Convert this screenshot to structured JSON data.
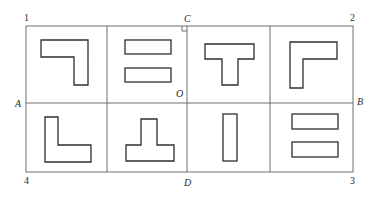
{
  "figure": {
    "background": "#ffffff",
    "line_color": "#6e6e6e",
    "shape_color": "#2f2f2f",
    "outer_frame": {
      "x": 26,
      "y": 26,
      "w": 327,
      "h": 146
    },
    "axes": {
      "vertical_CD_x": 187,
      "horizontal_AB_y": 103,
      "divider_left_x": 107,
      "divider_right_x": 270
    },
    "labels": {
      "corner_1": "1",
      "corner_2": "2",
      "corner_3": "3",
      "corner_4": "4",
      "point_A": "A",
      "point_B": "B",
      "point_C": "C",
      "point_D": "D",
      "point_O": "O"
    },
    "cells": [
      {
        "id": 1,
        "shape": "L-shape (corner top-right)",
        "points": "41,40 88,40 88,85 74,85 74,57 41,57"
      },
      {
        "id": 2,
        "shape": "two horizontal bars",
        "rects": [
          [
            125,
            40,
            46,
            14
          ],
          [
            125,
            68,
            46,
            14
          ]
        ]
      },
      {
        "id": 3,
        "shape": "T-shape",
        "points": "205,44 254,44 254,59 238,59 238,85 222,85 222,59 205,59"
      },
      {
        "id": 4,
        "shape": "L-shape (corner top-left)",
        "points": "290,42 337,42 337,59 303,59 303,88 290,88"
      },
      {
        "id": 5,
        "shape": "L-shape (corner bottom-left)",
        "points": "45,117 58,117 58,145 91,145 91,162 45,162"
      },
      {
        "id": 6,
        "shape": "inverted T-shape",
        "points": "141,119 157,119 157,145 174,145 174,161 126,161 126,145 141,145"
      },
      {
        "id": 7,
        "shape": "single vertical bar",
        "rects": [
          [
            223,
            114,
            14,
            47
          ]
        ]
      },
      {
        "id": 8,
        "shape": "two horizontal bars",
        "rects": [
          [
            292,
            114,
            46,
            15
          ],
          [
            292,
            142,
            46,
            15
          ]
        ]
      }
    ]
  }
}
